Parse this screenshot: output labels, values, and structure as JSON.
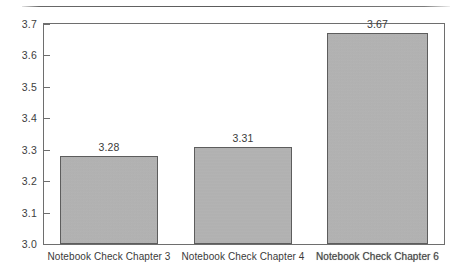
{
  "chart_data": {
    "type": "bar",
    "title": "",
    "subtitle": "",
    "xlabel": "",
    "ylabel": "",
    "categories": [
      "Notebook Check Chapter 3",
      "Notebook Check Chapter 4",
      "Notebook Check Chapter 6"
    ],
    "values": [
      3.28,
      3.31,
      3.67
    ],
    "value_labels": [
      "3.28",
      "3.31",
      "3.67"
    ],
    "ylim": [
      3.0,
      3.7
    ],
    "ytick_step": 0.1,
    "ytick_labels": [
      "3.7",
      "3.6",
      "3.5",
      "3.4",
      "3.3",
      "3.2",
      "3.1",
      "3.0"
    ],
    "ytick_values": [
      3.7,
      3.6,
      3.5,
      3.4,
      3.3,
      3.2,
      3.1,
      3.0
    ],
    "grid": false,
    "legend": false,
    "legend_position": "none",
    "bar_color": "#b4b4b4",
    "bar_border_color": "#5d5d5d",
    "axis_color": "#6e6e6e",
    "text_color": "#3a3a3a",
    "background": "#ffffff"
  }
}
